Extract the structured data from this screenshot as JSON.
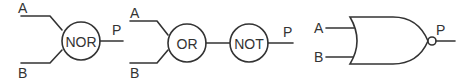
{
  "diagram": {
    "colors": {
      "stroke": "#333333",
      "background": "#ffffff"
    },
    "nor_block": {
      "input_a": "A",
      "input_b": "B",
      "gate_label": "NOR",
      "output": "P"
    },
    "or_not_chain": {
      "input_a": "A",
      "input_b": "B",
      "gate1_label": "OR",
      "gate2_label": "NOT",
      "output": "P"
    },
    "nor_symbol": {
      "input_a": "A",
      "input_b": "B",
      "output": "P"
    }
  }
}
